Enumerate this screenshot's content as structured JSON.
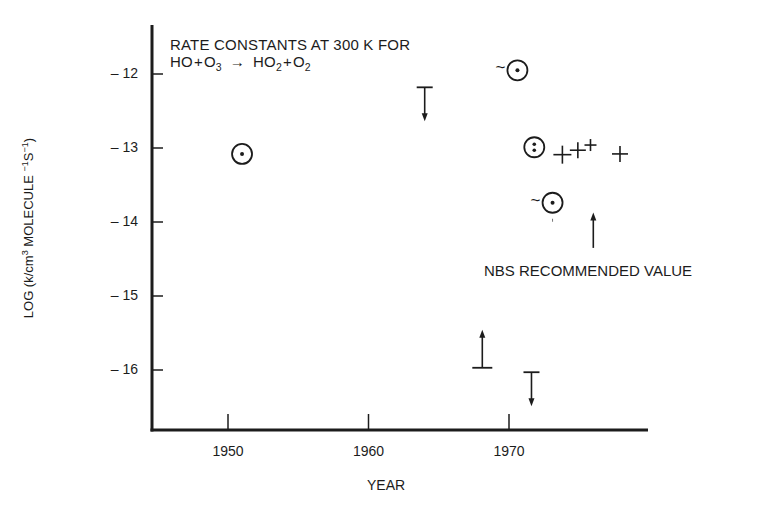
{
  "chart_data": {
    "type": "scatter",
    "title_lines": [
      "RATE CONSTANTS AT 300 K FOR",
      "HO + O3 → HO2 + O2"
    ],
    "title_html_line2": [
      "HO",
      "+",
      "O",
      "3",
      "→",
      "HO",
      "2",
      "+",
      "O",
      "2"
    ],
    "xlabel": "YEAR",
    "ylabel": "LOG (k/cm3 MOLECULE −1S−1)",
    "ylabel_parts": {
      "pre": "LOG (k/cm",
      "sup1": "3",
      "mid": " MOLECULE ",
      "sup2": "−1",
      "mid2": "S",
      "sup3": "−1",
      "post": ")"
    },
    "x_ticks": [
      1950,
      1960,
      1970
    ],
    "x_tick_labels": [
      "1950",
      "1960",
      "1970"
    ],
    "y_ticks": [
      -12,
      -13,
      -14,
      -15,
      -16
    ],
    "y_tick_labels": [
      "– 12",
      "– 13",
      "– 14",
      "– 15",
      "– 16"
    ],
    "xlim": [
      1944.6,
      1979.9
    ],
    "ylim": [
      -16.8,
      -11.35
    ],
    "grid": false,
    "legend": null,
    "series": [
      {
        "name": "measurements (circled points)",
        "marker": "circle-dot",
        "points": [
          {
            "x": 1951.0,
            "y": -13.08,
            "approx": false,
            "dots": 1
          },
          {
            "x": 1970.6,
            "y": -11.95,
            "approx": true,
            "dots": 1
          },
          {
            "x": 1971.8,
            "y": -12.99,
            "approx": false,
            "dots": 2
          },
          {
            "x": 1973.1,
            "y": -13.74,
            "approx": true,
            "dots": 1
          }
        ]
      },
      {
        "name": "measurements (crosses)",
        "marker": "plus",
        "points": [
          {
            "x": 1973.8,
            "y": -13.09,
            "size": 9
          },
          {
            "x": 1974.9,
            "y": -13.03,
            "size": 8
          },
          {
            "x": 1975.8,
            "y": -12.96,
            "size": 6
          },
          {
            "x": 1977.9,
            "y": -13.08,
            "size": 8
          }
        ]
      },
      {
        "name": "upper limits",
        "marker": "bar-arrow-down",
        "points": [
          {
            "x": 1964.0,
            "y": -12.18
          },
          {
            "x": 1971.6,
            "y": -16.03
          }
        ]
      },
      {
        "name": "lower limits",
        "marker": "bar-arrow-up",
        "points": [
          {
            "x": 1968.1,
            "y": -15.97
          }
        ]
      }
    ],
    "annotations": [
      {
        "text": "NBS RECOMMENDED VALUE",
        "arrow_x": 1976.0,
        "arrow_from_y": -14.35,
        "arrow_to_y": -13.87
      }
    ]
  },
  "layout": {
    "plot_px": {
      "x0": 152,
      "x1": 648,
      "y_top": 25,
      "y_axis": 430
    },
    "x_map": {
      "year0": 1950,
      "px0": 228,
      "px_per_year": 14.05
    },
    "y_map": {
      "val0": -12,
      "px0": 74,
      "px_per_unit": 74
    },
    "ink": "#1c1c1c"
  }
}
